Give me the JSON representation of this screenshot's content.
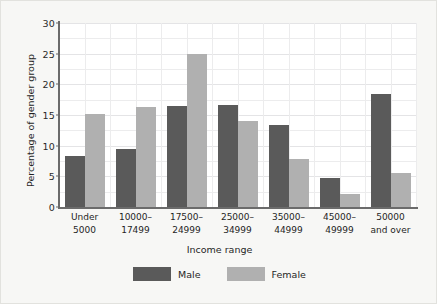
{
  "chart_data": {
    "type": "bar",
    "title": "",
    "subtitle": "",
    "xlabel": "Income range",
    "ylabel": "Percentage of gender group",
    "ylim": [
      0,
      30
    ],
    "yticks": [
      0,
      5,
      10,
      15,
      20,
      25,
      30
    ],
    "ytick_labels": [
      "0",
      "5",
      "10",
      "15",
      "20",
      "25",
      "30"
    ],
    "grid": true,
    "legend_position": "bottom",
    "categories": [
      "Under\n5000",
      "10000–\n17499",
      "17500–\n24999",
      "25000–\n34999",
      "35000–\n44999",
      "45000–\n49999",
      "50000\nand over"
    ],
    "series": [
      {
        "name": "Male",
        "color": "#5a5a5a",
        "values": [
          8.3,
          9.4,
          16.5,
          16.7,
          13.3,
          4.7,
          18.5
        ]
      },
      {
        "name": "Female",
        "color": "#b0b0b0",
        "values": [
          15.2,
          16.3,
          25.0,
          14.0,
          7.8,
          2.1,
          5.5
        ]
      }
    ]
  },
  "legend": {
    "items": [
      {
        "label": "Male",
        "color": "#5a5a5a"
      },
      {
        "label": "Female",
        "color": "#b0b0b0"
      }
    ]
  },
  "colors": {
    "male": "#5a5a5a",
    "female": "#b0b0b0",
    "figure_background": "#f7f7f5",
    "plot_background": "#ffffff",
    "axis": "#6b6b6b",
    "gridline": "#ececed",
    "text": "#1f1f1f"
  }
}
